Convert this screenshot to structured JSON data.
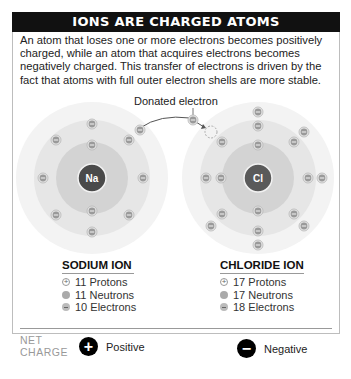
{
  "header": {
    "title": "IONS ARE CHARGED ATOMS"
  },
  "intro": "An atom that loses one or more electrons becomes positively charged, while an atom that acquires electrons becomes negatively charged. This transfer of electrons is driven by the fact that atoms with full outer electron shells are more stable.",
  "diagram": {
    "donated_label": "Donated electron",
    "sodium": {
      "symbol": "Na"
    },
    "chloride": {
      "symbol": "Cl"
    }
  },
  "sodium_ion": {
    "title": "SODIUM ION",
    "protons": "11 Protons",
    "neutrons": "11 Neutrons",
    "electrons": "10 Electrons"
  },
  "chloride_ion": {
    "title": "CHLORIDE ION",
    "protons": "17 Protons",
    "neutrons": "17 Neutrons",
    "electrons": "18 Electrons"
  },
  "net_charge": {
    "label_line1": "NET",
    "label_line2": "CHARGE",
    "sodium": {
      "symbol": "+",
      "label": "Positive"
    },
    "chloride": {
      "symbol": "−",
      "label": "Negative"
    }
  },
  "colors": {
    "title_bar": "#111111",
    "nucleus": "#4a4a4a",
    "ring_outer": "#f1f1f1",
    "ring_middle": "#e3e3e3",
    "ring_inner": "#d0d0d0",
    "electron": "#bdbdbd"
  }
}
